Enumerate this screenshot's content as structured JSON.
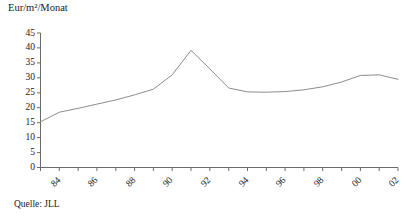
{
  "figure": {
    "y_axis_title": "Eur/m²/Monat",
    "source_note": "Quelle: JLL"
  },
  "chart_data": {
    "type": "line",
    "title": "",
    "subtitle": "",
    "xlabel": "",
    "ylabel": "Eur/m²/Monat",
    "ylim": [
      0,
      45
    ],
    "xlim": [
      1984,
      2003
    ],
    "grid": false,
    "legend": null,
    "legend_position": "none",
    "line_color": "#8c8c8c",
    "axis_color": "#6b6b6b",
    "y_ticks": [
      0,
      5,
      10,
      15,
      20,
      25,
      30,
      35,
      40,
      45
    ],
    "y_tick_labels": [
      "0",
      "5",
      "10",
      "15",
      "20",
      "25",
      "30",
      "35",
      "40",
      "45"
    ],
    "x_ticks": [
      1984,
      1985,
      1986,
      1987,
      1988,
      1989,
      1990,
      1991,
      1992,
      1993,
      1994,
      1995,
      1996,
      1997,
      1998,
      1999,
      2000,
      2001,
      2002,
      2003
    ],
    "x_tick_labels": [
      "84",
      "",
      "86",
      "",
      "88",
      "",
      "90",
      "",
      "92",
      "",
      "94",
      "",
      "96",
      "",
      "98",
      "",
      "00",
      "",
      "02",
      ""
    ],
    "x_labeled_ticks": [
      {
        "x": 1984,
        "label": "84"
      },
      {
        "x": 1986,
        "label": "86"
      },
      {
        "x": 1988,
        "label": "88"
      },
      {
        "x": 1990,
        "label": "90"
      },
      {
        "x": 1992,
        "label": "92"
      },
      {
        "x": 1994,
        "label": "94"
      },
      {
        "x": 1996,
        "label": "96"
      },
      {
        "x": 1998,
        "label": "98"
      },
      {
        "x": 2000,
        "label": "00"
      },
      {
        "x": 2002,
        "label": "02"
      }
    ],
    "series": [
      {
        "name": "Eur/m²/Monat",
        "x": [
          1984,
          1985,
          1986,
          1987,
          1988,
          1989,
          1990,
          1991,
          1992,
          1993,
          1994,
          1995,
          1996,
          1997,
          1998,
          1999,
          2000,
          2001,
          2002,
          2003
        ],
        "values": [
          15.3,
          18.5,
          19.8,
          21.2,
          22.6,
          24.3,
          26.2,
          31.0,
          39.2,
          33.0,
          26.6,
          25.3,
          25.2,
          25.4,
          26.0,
          27.0,
          28.6,
          30.8,
          31.0,
          29.5
        ]
      }
    ]
  }
}
